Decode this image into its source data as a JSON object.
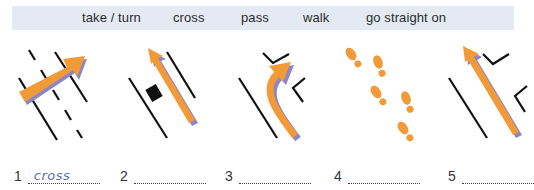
{
  "word_box": {
    "words": [
      "take / turn",
      "cross",
      "pass",
      "walk",
      "go straight on"
    ]
  },
  "pictures": [
    {
      "icon": "arrow-crossing-road-icon",
      "description": "arrow crossing dashed road lanes"
    },
    {
      "icon": "arrow-passing-car-icon",
      "description": "arrow passing a parked car"
    },
    {
      "icon": "arrow-turning-icon",
      "description": "arrow turning into a side road"
    },
    {
      "icon": "footprints-icon",
      "description": "walking footprints"
    },
    {
      "icon": "arrow-straight-on-icon",
      "description": "arrow going straight past junctions"
    }
  ],
  "answers": [
    {
      "number": "1",
      "value": "cross"
    },
    {
      "number": "2",
      "value": ""
    },
    {
      "number": "3",
      "value": ""
    },
    {
      "number": "4",
      "value": ""
    },
    {
      "number": "5",
      "value": ""
    }
  ],
  "colors": {
    "banner": "#e3eaf3",
    "arrow": "#f29a38",
    "arrow_shadow": "#8a86c8",
    "handwriting": "#5b6fa8"
  }
}
